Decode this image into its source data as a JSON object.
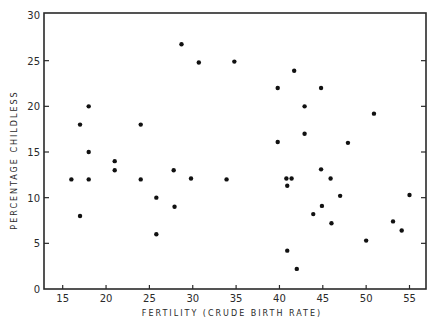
{
  "chart_data": {
    "type": "scatter",
    "title": "",
    "xlabel": "FERTILITY (CRUDE BIRTH RATE)",
    "ylabel": "PERCENTAGE CHILDLESS",
    "xlim": [
      13,
      57
    ],
    "ylim": [
      0,
      30
    ],
    "xticks": [
      15,
      20,
      25,
      30,
      35,
      40,
      45,
      50,
      55
    ],
    "yticks": [
      0,
      5,
      10,
      15,
      20,
      25,
      30
    ],
    "grid": false,
    "legend": null,
    "marker_color": "#111111",
    "points": [
      {
        "x": 18,
        "y": 20
      },
      {
        "x": 17,
        "y": 18
      },
      {
        "x": 24,
        "y": 18
      },
      {
        "x": 18,
        "y": 15
      },
      {
        "x": 21,
        "y": 14
      },
      {
        "x": 21,
        "y": 13
      },
      {
        "x": 16,
        "y": 12
      },
      {
        "x": 18,
        "y": 12
      },
      {
        "x": 24,
        "y": 12
      },
      {
        "x": 17,
        "y": 8
      },
      {
        "x": 28.7,
        "y": 26.8
      },
      {
        "x": 30.7,
        "y": 24.8
      },
      {
        "x": 34.8,
        "y": 24.9
      },
      {
        "x": 27.8,
        "y": 13.0
      },
      {
        "x": 29.8,
        "y": 12.1
      },
      {
        "x": 33.9,
        "y": 12.0
      },
      {
        "x": 25.8,
        "y": 10.0
      },
      {
        "x": 27.9,
        "y": 9.0
      },
      {
        "x": 25.8,
        "y": 6.0
      },
      {
        "x": 41.7,
        "y": 23.9
      },
      {
        "x": 39.8,
        "y": 22.0
      },
      {
        "x": 44.8,
        "y": 22.0
      },
      {
        "x": 42.9,
        "y": 20.0
      },
      {
        "x": 42.9,
        "y": 17.0
      },
      {
        "x": 39.8,
        "y": 16.1
      },
      {
        "x": 47.9,
        "y": 16.0
      },
      {
        "x": 44.8,
        "y": 13.1
      },
      {
        "x": 45.9,
        "y": 12.1
      },
      {
        "x": 40.8,
        "y": 12.1
      },
      {
        "x": 41.4,
        "y": 12.1
      },
      {
        "x": 40.9,
        "y": 11.3
      },
      {
        "x": 47.0,
        "y": 10.2
      },
      {
        "x": 44.9,
        "y": 9.1
      },
      {
        "x": 43.9,
        "y": 8.2
      },
      {
        "x": 46.0,
        "y": 7.2
      },
      {
        "x": 50.0,
        "y": 5.3
      },
      {
        "x": 40.9,
        "y": 4.2
      },
      {
        "x": 42.0,
        "y": 2.2
      },
      {
        "x": 50.9,
        "y": 19.2
      },
      {
        "x": 55.0,
        "y": 10.3
      },
      {
        "x": 53.1,
        "y": 7.4
      },
      {
        "x": 54.1,
        "y": 6.4
      }
    ]
  }
}
